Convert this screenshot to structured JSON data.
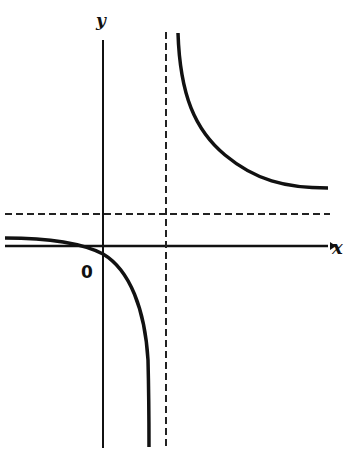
{
  "diagram": {
    "type": "function-graph",
    "labels": {
      "x_axis": "x",
      "y_axis": "y",
      "origin": "0"
    },
    "asymptotes": {
      "vertical": {
        "style": "dashed",
        "position": "x = a, a > 0"
      },
      "horizontal": {
        "style": "dashed",
        "position": "y = b, b > 0"
      }
    },
    "branches": [
      {
        "name": "upper-right",
        "description": "decreasing, approaches vertical asymptote upward and horizontal asymptote from above"
      },
      {
        "name": "lower-left",
        "description": "decreasing, passes through origin, approaches horizontal asymptote from below on the left and vertical asymptote downward"
      }
    ],
    "colors": {
      "curve": "#111111",
      "axis": "#111111",
      "asymptote": "#222222",
      "background": "#ffffff"
    }
  }
}
